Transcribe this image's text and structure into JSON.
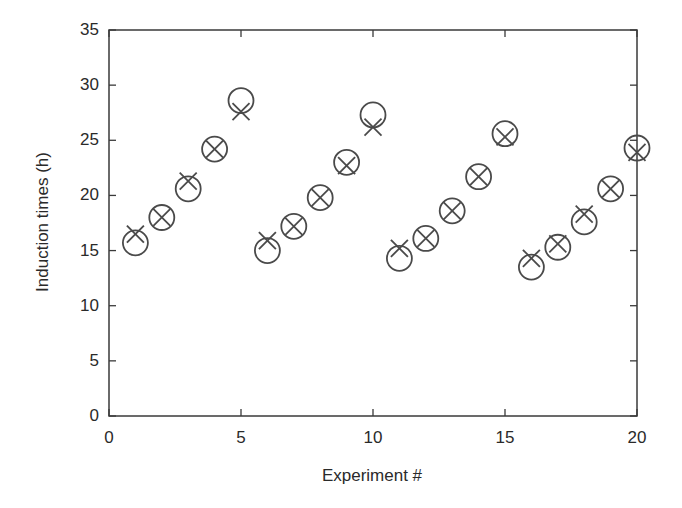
{
  "chart_data": {
    "type": "scatter",
    "title": "",
    "xlabel": "Experiment #",
    "ylabel": "Induction times (h)",
    "xlim": [
      0,
      20
    ],
    "ylim": [
      0,
      35
    ],
    "xticks": [
      0,
      5,
      10,
      15,
      20
    ],
    "yticks": [
      0,
      5,
      10,
      15,
      20,
      25,
      30,
      35
    ],
    "grid": false,
    "legend": null,
    "x": [
      1,
      2,
      3,
      4,
      5,
      6,
      7,
      8,
      9,
      10,
      11,
      12,
      13,
      14,
      15,
      16,
      17,
      18,
      19,
      20
    ],
    "series": [
      {
        "name": "circles",
        "marker": "circle",
        "values": [
          15.7,
          18.0,
          20.6,
          24.2,
          28.6,
          15.0,
          17.2,
          19.8,
          23.0,
          27.3,
          14.3,
          16.1,
          18.6,
          21.7,
          25.6,
          13.5,
          15.3,
          17.6,
          20.6,
          24.3
        ]
      },
      {
        "name": "crosses",
        "marker": "x",
        "values": [
          16.5,
          18.0,
          21.3,
          24.2,
          27.6,
          15.9,
          17.2,
          19.8,
          22.7,
          26.2,
          15.2,
          16.1,
          18.6,
          21.7,
          25.3,
          14.3,
          15.6,
          18.3,
          20.6,
          23.9
        ]
      }
    ]
  },
  "style": {
    "axis_color": "#3a3a3a",
    "marker_color": "#4a4a4a",
    "background": "#ffffff"
  },
  "labels": {
    "xlabel": "Experiment #",
    "ylabel": "Induction times (h)"
  }
}
